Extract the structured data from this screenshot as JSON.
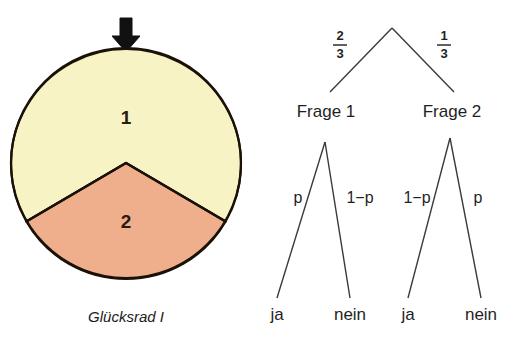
{
  "figure": {
    "background": "#ffffff",
    "wheel": {
      "caption": "Glücksrad I",
      "pointer_icon": "down-arrow-icon",
      "sectors": [
        {
          "label": "1",
          "color": "#F7F3C4",
          "fraction": "2/3",
          "degrees": 240
        },
        {
          "label": "2",
          "color": "#EFAF8C",
          "fraction": "1/3",
          "degrees": 120
        }
      ],
      "outline_color": "#1a1208"
    },
    "tree": {
      "root_branches": [
        {
          "probability_numerator": "2",
          "probability_denominator": "3",
          "target": "Frage 1"
        },
        {
          "probability_numerator": "1",
          "probability_denominator": "3",
          "target": "Frage 2"
        }
      ],
      "nodes": [
        {
          "label": "Frage 1"
        },
        {
          "label": "Frage 2"
        }
      ],
      "branch_labels": [
        "p",
        "1−p",
        "1−p",
        "p"
      ],
      "leaves": [
        "ja",
        "nein",
        "ja",
        "nein"
      ],
      "line_color": "#3a3a3a"
    }
  }
}
